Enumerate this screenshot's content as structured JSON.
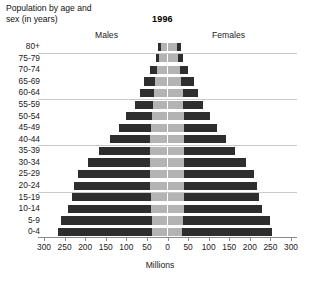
{
  "title": {
    "line1": "Population by age and",
    "line2": "sex (in years)",
    "full": "Population by age and sex (in years)"
  },
  "year_label": "1996",
  "headers": {
    "left": "Males",
    "right": "Females"
  },
  "axis": {
    "x_title": "Millions",
    "x_ticklabels": [
      "300",
      "250",
      "200",
      "150",
      "100",
      "50",
      "0",
      "50",
      "100",
      "150",
      "200",
      "250",
      "300"
    ],
    "y_title": ""
  },
  "colors": {
    "developing": "#2e2e2e",
    "developed": "#b3b3b3",
    "gridline": "#c9c9c9",
    "axis": "#8a8a8a",
    "background": "#ffffff",
    "text": "#222222"
  },
  "chart_data": {
    "type": "bar",
    "subtype": "population-pyramid",
    "annotation": "1996",
    "xlabel": "Millions",
    "ylabel": "Population by age and sex (in years)",
    "xlim": [
      -300,
      300
    ],
    "xticks": [
      -300,
      -250,
      -200,
      -150,
      -100,
      -50,
      0,
      50,
      100,
      150,
      200,
      250,
      300
    ],
    "xticklabels": [
      "300",
      "250",
      "200",
      "150",
      "100",
      "50",
      "0",
      "50",
      "100",
      "150",
      "200",
      "250",
      "300"
    ],
    "grid": "horizontal-major",
    "legend": "none",
    "categories": [
      "0-4",
      "5-9",
      "10-14",
      "15-19",
      "20-24",
      "25-29",
      "30-34",
      "35-39",
      "40-44",
      "45-49",
      "50-54",
      "55-59",
      "60-64",
      "65-69",
      "70-74",
      "75-79",
      "80+"
    ],
    "category_order_bottom_to_top": [
      "0-4",
      "5-9",
      "10-14",
      "15-19",
      "20-24",
      "25-29",
      "30-34",
      "35-39",
      "40-44",
      "45-49",
      "50-54",
      "55-59",
      "60-64",
      "65-69",
      "70-74",
      "75-79",
      "80+"
    ],
    "stack_segments": [
      "developed (inner light)",
      "developing (outer dark)"
    ],
    "series": [
      {
        "name": "Males total",
        "side": "left",
        "values": [
          266,
          259,
          241,
          232,
          226,
          218,
          194,
          166,
          140,
          118,
          100,
          80,
          68,
          56,
          42,
          29,
          22
        ]
      },
      {
        "name": "Females total",
        "side": "right",
        "values": [
          255,
          248,
          230,
          222,
          218,
          211,
          190,
          165,
          141,
          121,
          104,
          86,
          75,
          64,
          51,
          38,
          33
        ]
      }
    ],
    "males_developed_inner": [
      38,
      38,
      40,
      41,
      42,
      42,
      42,
      42,
      42,
      40,
      38,
      36,
      34,
      30,
      25,
      20,
      16
    ],
    "males_developing_outer": [
      228,
      221,
      201,
      191,
      184,
      176,
      152,
      124,
      98,
      78,
      62,
      44,
      34,
      26,
      17,
      9,
      6
    ],
    "females_developed_inner": [
      36,
      37,
      39,
      40,
      41,
      41,
      41,
      41,
      41,
      40,
      39,
      38,
      37,
      34,
      30,
      26,
      22
    ],
    "females_developing_outer": [
      219,
      211,
      191,
      182,
      177,
      170,
      149,
      124,
      100,
      81,
      65,
      48,
      38,
      30,
      21,
      12,
      11
    ]
  },
  "rows": [
    {
      "label": "80+",
      "m_dev": 16,
      "m_ing": 6,
      "f_dev": 22,
      "f_ing": 11
    },
    {
      "label": "75-79",
      "m_dev": 20,
      "m_ing": 9,
      "f_dev": 26,
      "f_ing": 12
    },
    {
      "label": "70-74",
      "m_dev": 25,
      "m_ing": 17,
      "f_dev": 30,
      "f_ing": 21
    },
    {
      "label": "65-69",
      "m_dev": 30,
      "m_ing": 26,
      "f_dev": 34,
      "f_ing": 30
    },
    {
      "label": "60-64",
      "m_dev": 34,
      "m_ing": 34,
      "f_dev": 37,
      "f_ing": 38
    },
    {
      "label": "55-59",
      "m_dev": 36,
      "m_ing": 44,
      "f_dev": 38,
      "f_ing": 48
    },
    {
      "label": "50-54",
      "m_dev": 38,
      "m_ing": 62,
      "f_dev": 39,
      "f_ing": 65
    },
    {
      "label": "45-49",
      "m_dev": 40,
      "m_ing": 78,
      "f_dev": 40,
      "f_ing": 81
    },
    {
      "label": "40-44",
      "m_dev": 42,
      "m_ing": 98,
      "f_dev": 41,
      "f_ing": 100
    },
    {
      "label": "35-39",
      "m_dev": 42,
      "m_ing": 124,
      "f_dev": 41,
      "f_ing": 124
    },
    {
      "label": "30-34",
      "m_dev": 42,
      "m_ing": 152,
      "f_dev": 41,
      "f_ing": 149
    },
    {
      "label": "25-29",
      "m_dev": 42,
      "m_ing": 176,
      "f_dev": 41,
      "f_ing": 170
    },
    {
      "label": "20-24",
      "m_dev": 42,
      "m_ing": 184,
      "f_dev": 41,
      "f_ing": 177
    },
    {
      "label": "15-19",
      "m_dev": 41,
      "m_ing": 191,
      "f_dev": 40,
      "f_ing": 182
    },
    {
      "label": "10-14",
      "m_dev": 40,
      "m_ing": 201,
      "f_dev": 39,
      "f_ing": 191
    },
    {
      "label": "5-9",
      "m_dev": 38,
      "m_ing": 221,
      "f_dev": 37,
      "f_ing": 211
    },
    {
      "label": "0-4",
      "m_dev": 38,
      "m_ing": 228,
      "f_dev": 36,
      "f_ing": 219
    }
  ]
}
